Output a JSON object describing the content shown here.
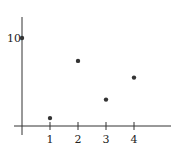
{
  "chart_data": {
    "type": "scatter",
    "title": "",
    "xlabel": "",
    "ylabel": "",
    "x": [
      0,
      1,
      2,
      3,
      4
    ],
    "values": [
      10,
      0.9,
      7.4,
      3.0,
      5.5
    ],
    "x_ticks": [
      "1",
      "2",
      "3",
      "4"
    ],
    "y_ticks": [
      "10"
    ],
    "xlim": [
      -0.3,
      5.3
    ],
    "ylim": [
      -1,
      12.3
    ],
    "grid": false,
    "legend": null
  },
  "colors": {
    "axis": "#333333",
    "point": "#333333"
  }
}
